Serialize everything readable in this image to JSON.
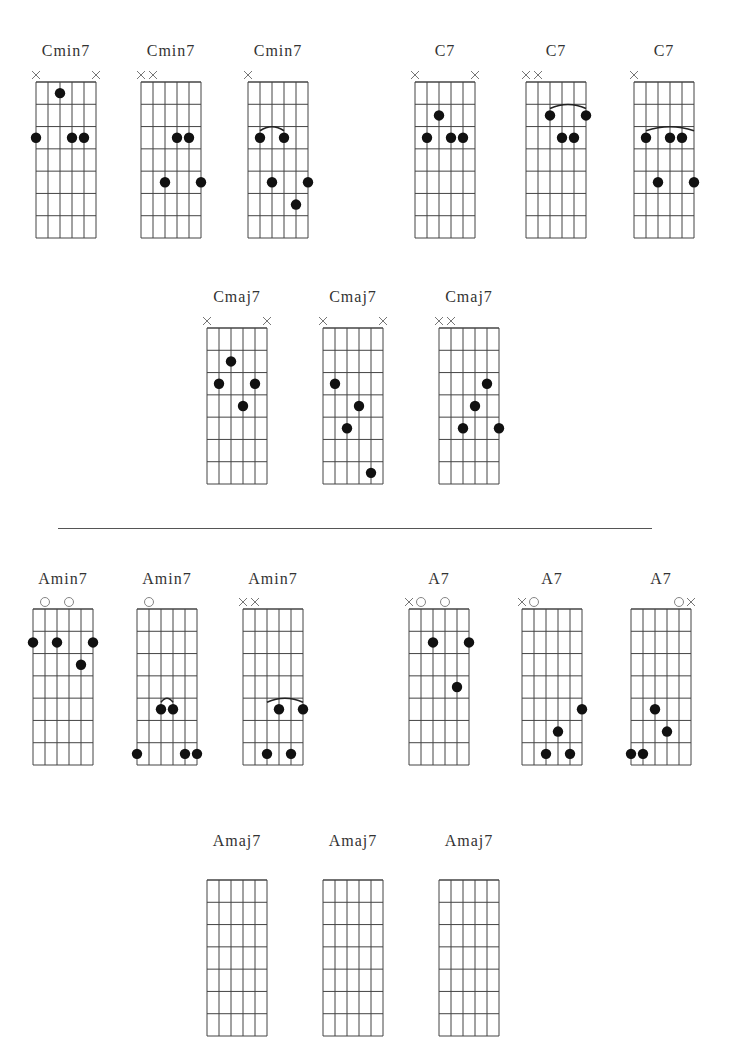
{
  "page": {
    "background": "#ffffff",
    "line_color": "#444444",
    "dot_color": "#111111"
  },
  "grid": {
    "strings": 6,
    "frets": 7,
    "width": 60,
    "height": 156
  },
  "sections": [
    {
      "name": "C chords",
      "chords": [
        {
          "name": "Cmin7",
          "x": 36,
          "y": 82,
          "label_x": 36,
          "label_y": 44,
          "marks": [
            "x",
            "",
            "",
            "",
            "",
            "x"
          ],
          "dots": [
            [
              3,
              1
            ],
            [
              1,
              3
            ],
            [
              4,
              3
            ],
            [
              5,
              3
            ]
          ],
          "barres": []
        },
        {
          "name": "Cmin7",
          "x": 141,
          "y": 82,
          "label_x": 141,
          "label_y": 44,
          "marks": [
            "x",
            "x",
            "",
            "",
            "",
            ""
          ],
          "dots": [
            [
              4,
              3
            ],
            [
              5,
              3
            ],
            [
              3,
              5
            ],
            [
              6,
              5
            ]
          ],
          "barres": []
        },
        {
          "name": "Cmin7",
          "x": 248,
          "y": 82,
          "label_x": 248,
          "label_y": 44,
          "marks": [
            "x",
            "",
            "",
            "",
            "",
            ""
          ],
          "dots": [
            [
              2,
              3
            ],
            [
              4,
              3
            ],
            [
              3,
              5
            ],
            [
              6,
              5
            ],
            [
              5,
              6
            ]
          ],
          "barres": [
            [
              2,
              4,
              3
            ]
          ]
        },
        {
          "name": "C7",
          "x": 415,
          "y": 82,
          "label_x": 415,
          "label_y": 44,
          "marks": [
            "x",
            "",
            "",
            "",
            "",
            "x"
          ],
          "dots": [
            [
              3,
              2
            ],
            [
              2,
              3
            ],
            [
              4,
              3
            ],
            [
              5,
              3
            ]
          ],
          "barres": []
        },
        {
          "name": "C7",
          "x": 526,
          "y": 82,
          "label_x": 526,
          "label_y": 44,
          "marks": [
            "x",
            "x",
            "",
            "",
            "",
            ""
          ],
          "dots": [
            [
              3,
              2
            ],
            [
              6,
              2
            ],
            [
              4,
              3
            ],
            [
              5,
              3
            ]
          ],
          "barres": [
            [
              3,
              6,
              2
            ]
          ]
        },
        {
          "name": "C7",
          "x": 634,
          "y": 82,
          "label_x": 634,
          "label_y": 44,
          "marks": [
            "x",
            "",
            "",
            "",
            "",
            ""
          ],
          "dots": [
            [
              2,
              3
            ],
            [
              4,
              3
            ],
            [
              5,
              3
            ],
            [
              3,
              5
            ],
            [
              6,
              5
            ]
          ],
          "barres": [
            [
              2,
              6,
              3
            ]
          ]
        }
      ]
    },
    {
      "name": "Cmaj7 chords",
      "chords": [
        {
          "name": "Cmaj7",
          "x": 207,
          "y": 328,
          "label_x": 207,
          "label_y": 290,
          "marks": [
            "x",
            "",
            "",
            "",
            "",
            "x"
          ],
          "dots": [
            [
              3,
              2
            ],
            [
              2,
              3
            ],
            [
              5,
              3
            ],
            [
              4,
              4
            ]
          ],
          "barres": []
        },
        {
          "name": "Cmaj7",
          "x": 323,
          "y": 328,
          "label_x": 323,
          "label_y": 290,
          "marks": [
            "x",
            "",
            "",
            "",
            "",
            "x"
          ],
          "dots": [
            [
              2,
              3
            ],
            [
              4,
              4
            ],
            [
              3,
              5
            ],
            [
              5,
              7
            ]
          ],
          "barres": []
        },
        {
          "name": "Cmaj7",
          "x": 439,
          "y": 328,
          "label_x": 439,
          "label_y": 290,
          "marks": [
            "x",
            "x",
            "",
            "",
            "",
            ""
          ],
          "dots": [
            [
              5,
              3
            ],
            [
              4,
              4
            ],
            [
              3,
              5
            ],
            [
              6,
              5
            ]
          ],
          "barres": []
        }
      ]
    },
    {
      "name": "A chords",
      "chords": [
        {
          "name": "Amin7",
          "x": 33,
          "y": 609,
          "label_x": 33,
          "label_y": 572,
          "marks": [
            "",
            "o",
            "",
            "o",
            "",
            ""
          ],
          "dots": [
            [
              1,
              2
            ],
            [
              3,
              2
            ],
            [
              6,
              2
            ],
            [
              5,
              3
            ]
          ],
          "barres": []
        },
        {
          "name": "Amin7",
          "x": 137,
          "y": 609,
          "label_x": 137,
          "label_y": 572,
          "marks": [
            "",
            "o",
            "",
            "",
            "",
            ""
          ],
          "dots": [
            [
              3,
              5
            ],
            [
              4,
              5
            ],
            [
              1,
              7
            ],
            [
              5,
              7
            ],
            [
              6,
              7
            ]
          ],
          "barres": [
            [
              3,
              4,
              5
            ]
          ]
        },
        {
          "name": "Amin7",
          "x": 243,
          "y": 609,
          "label_x": 243,
          "label_y": 572,
          "marks": [
            "x",
            "x",
            "",
            "",
            "",
            ""
          ],
          "dots": [
            [
              4,
              5
            ],
            [
              6,
              5
            ],
            [
              3,
              7
            ],
            [
              5,
              7
            ]
          ],
          "barres": [
            [
              3,
              6,
              5
            ]
          ]
        },
        {
          "name": "A7",
          "x": 409,
          "y": 609,
          "label_x": 409,
          "label_y": 572,
          "marks": [
            "x",
            "o",
            "",
            "o",
            "",
            ""
          ],
          "dots": [
            [
              3,
              2
            ],
            [
              6,
              2
            ],
            [
              5,
              4
            ]
          ],
          "barres": []
        },
        {
          "name": "A7",
          "x": 522,
          "y": 609,
          "label_x": 522,
          "label_y": 572,
          "marks": [
            "x",
            "o",
            "",
            "",
            "",
            ""
          ],
          "dots": [
            [
              6,
              5
            ],
            [
              4,
              6
            ],
            [
              3,
              7
            ],
            [
              5,
              7
            ]
          ],
          "barres": []
        },
        {
          "name": "A7",
          "x": 631,
          "y": 609,
          "label_x": 631,
          "label_y": 572,
          "marks": [
            "",
            "",
            "",
            "",
            "o",
            "x"
          ],
          "dots": [
            [
              3,
              5
            ],
            [
              4,
              6
            ],
            [
              1,
              7
            ],
            [
              2,
              7
            ]
          ],
          "barres": []
        }
      ]
    },
    {
      "name": "Amaj7 chords (cut off)",
      "chords": [
        {
          "name": "Amaj7",
          "x": 207,
          "y": 880,
          "label_x": 207,
          "label_y": 834,
          "marks": [
            "",
            "",
            "",
            "",
            "",
            ""
          ],
          "dots": [],
          "barres": []
        },
        {
          "name": "Amaj7",
          "x": 323,
          "y": 880,
          "label_x": 323,
          "label_y": 834,
          "marks": [
            "",
            "",
            "",
            "",
            "",
            ""
          ],
          "dots": [],
          "barres": []
        },
        {
          "name": "Amaj7",
          "x": 439,
          "y": 880,
          "label_x": 439,
          "label_y": 834,
          "marks": [
            "",
            "",
            "",
            "",
            "",
            ""
          ],
          "dots": [],
          "barres": []
        }
      ]
    }
  ],
  "divider": {
    "y": 528,
    "x1": 58,
    "x2": 652
  }
}
